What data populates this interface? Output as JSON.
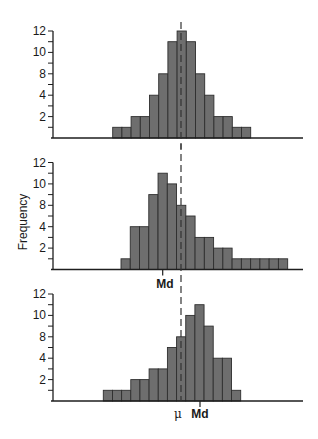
{
  "figure": {
    "ylabel": "Frequency",
    "colors": {
      "bar_fill": "#6e6e6e",
      "bar_stroke": "#2e2e2e",
      "axis": "#1e1e1e",
      "dash": "#333333"
    }
  },
  "chart_data": [
    {
      "type": "bar",
      "title": "Symmetric distribution",
      "ylabel": "",
      "xlabel": "",
      "y_tick_labels": [
        "2",
        "4",
        "8",
        "10",
        "12"
      ],
      "y_tick_label_positions": [
        2,
        4,
        6,
        8,
        10
      ],
      "ylim": [
        0,
        10
      ],
      "grid": false,
      "values": [
        1,
        1,
        2,
        2,
        4,
        6,
        9,
        10,
        9,
        6,
        4,
        2,
        2,
        1,
        1
      ],
      "annotations": []
    },
    {
      "type": "bar",
      "title": "Positively skewed distribution",
      "ylabel": "Frequency",
      "xlabel": "",
      "y_tick_labels": [
        "2",
        "4",
        "8",
        "10",
        "12"
      ],
      "y_tick_label_positions": [
        2,
        4,
        6,
        8,
        10
      ],
      "ylim": [
        0,
        10
      ],
      "grid": false,
      "values": [
        1,
        4,
        4,
        7,
        9,
        8,
        6,
        5,
        3,
        3,
        2,
        2,
        1,
        1,
        1,
        1,
        1,
        1
      ],
      "annotations": [
        {
          "text": "Md",
          "position": "below axis, left of dashed mean line"
        }
      ]
    },
    {
      "type": "bar",
      "title": "Negatively skewed distribution",
      "ylabel": "",
      "xlabel": "",
      "y_tick_labels": [
        "2",
        "4",
        "8",
        "10",
        "12"
      ],
      "y_tick_label_positions": [
        2,
        4,
        6,
        8,
        10
      ],
      "ylim": [
        0,
        10
      ],
      "grid": false,
      "values": [
        1,
        1,
        1,
        2,
        2,
        3,
        3,
        5,
        6,
        8,
        9,
        7,
        4,
        4,
        1
      ],
      "annotations": [
        {
          "text": "μ",
          "position": "below axis at dashed line"
        },
        {
          "text": "Md",
          "position": "below axis, right of dashed mean line"
        }
      ]
    }
  ],
  "labels": {
    "md_middle": "Md",
    "mu_bottom": "μ",
    "md_bottom": "Md"
  }
}
